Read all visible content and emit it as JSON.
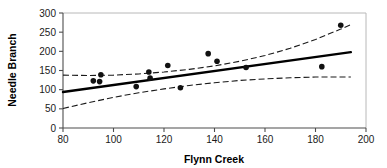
{
  "chart_data": {
    "type": "scatter",
    "title": "",
    "xlabel": "Flynn Creek",
    "ylabel": "Needle Branch",
    "xlim": [
      80,
      200
    ],
    "ylim": [
      0,
      300
    ],
    "xticks": [
      80,
      100,
      120,
      140,
      160,
      180,
      200
    ],
    "yticks": [
      0,
      50,
      100,
      150,
      200,
      250,
      300
    ],
    "xtick_labels": [
      "80",
      "100",
      "120",
      "140",
      "160",
      "180",
      "200"
    ],
    "ytick_labels": [
      "0",
      "50",
      "100",
      "150",
      "200",
      "250",
      "300"
    ],
    "grid": false,
    "legend": null,
    "points": [
      {
        "x": 92.0,
        "y": 123
      },
      {
        "x": 94.5,
        "y": 121
      },
      {
        "x": 95.0,
        "y": 139
      },
      {
        "x": 109.0,
        "y": 108
      },
      {
        "x": 114.0,
        "y": 146
      },
      {
        "x": 114.5,
        "y": 130
      },
      {
        "x": 121.5,
        "y": 163
      },
      {
        "x": 126.5,
        "y": 105
      },
      {
        "x": 137.5,
        "y": 194
      },
      {
        "x": 141.0,
        "y": 174
      },
      {
        "x": 152.5,
        "y": 158
      },
      {
        "x": 182.5,
        "y": 160
      },
      {
        "x": 190.0,
        "y": 268
      }
    ],
    "series": [
      {
        "name": "regression-line",
        "style": "solid",
        "x": [
          80,
          194
        ],
        "values": [
          94,
          198
        ]
      },
      {
        "name": "upper-confidence-band",
        "style": "dashed",
        "x": [
          80,
          90,
          100,
          110,
          120,
          130,
          140,
          150,
          160,
          170,
          180,
          190,
          194
        ],
        "values": [
          138,
          137,
          138,
          141,
          146,
          153,
          162,
          174,
          189,
          208,
          231,
          258,
          270
        ]
      },
      {
        "name": "lower-confidence-band",
        "style": "dashed",
        "x": [
          80,
          90,
          100,
          110,
          120,
          130,
          140,
          150,
          160,
          170,
          180,
          190,
          194
        ],
        "values": [
          51,
          66,
          80,
          92,
          102,
          111,
          118,
          124,
          128,
          131,
          133,
          133,
          133
        ]
      }
    ]
  },
  "colors": {
    "point": "#111111",
    "fit": "#000000",
    "band": "#1a1a1a",
    "axis": "#4d4d4d",
    "frame": "#b8b8b8",
    "background": "#ffffff"
  }
}
